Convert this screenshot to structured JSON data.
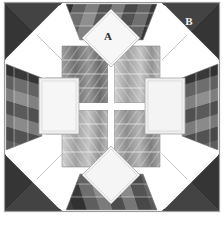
{
  "figure": {
    "type": "quilt-block-diagram",
    "width": 224,
    "height": 225,
    "background_color": "#ffffff"
  },
  "labels": [
    {
      "id": "A",
      "text": "A",
      "x": 108,
      "y": 37,
      "target": "top-center-light-diamond",
      "color": "#2b2b2b"
    },
    {
      "id": "B",
      "text": "B",
      "x": 189,
      "y": 22,
      "target": "top-right-dark-corner-triangle",
      "color": "#f2f2f2"
    }
  ],
  "palette": {
    "background": "#ffffff",
    "sashing": "#ffffff",
    "outline": "#8f8f8f",
    "corner_dark": "#3c3c3c",
    "corner_dark_shade": "#2f2f2f",
    "dark_1": "#2e2e2e",
    "dark_2": "#3a3a3a",
    "dark_3": "#484848",
    "dark_4": "#565656",
    "mid_1": "#6e6e6e",
    "mid_2": "#808080",
    "mid_3": "#949494",
    "mid_4": "#a6a6a6",
    "light_1": "#bdbdbd",
    "light_2": "#cfcfcf",
    "light_3": "#dedede",
    "light_4": "#eaeaea",
    "white_patch": "#f3f3f3",
    "white_patch_2": "#ececec"
  },
  "geometry": {
    "block_left": 4,
    "block_top": 2,
    "block_right": 220,
    "block_bottom": 212,
    "center_x": 111,
    "center_y": 106
  },
  "regions": [
    {
      "name": "corner-triangle-top-left",
      "shade": "dark"
    },
    {
      "name": "corner-triangle-top-right",
      "shade": "dark",
      "label": "B"
    },
    {
      "name": "corner-triangle-bottom-left",
      "shade": "dark"
    },
    {
      "name": "corner-triangle-bottom-right",
      "shade": "dark"
    },
    {
      "name": "light-diamond-top",
      "shade": "white",
      "label": "A"
    },
    {
      "name": "light-square-left",
      "shade": "white"
    },
    {
      "name": "light-square-right",
      "shade": "white"
    },
    {
      "name": "light-diamond-bottom",
      "shade": "white"
    },
    {
      "name": "center-star",
      "shade": "graded-chevron"
    },
    {
      "name": "edge-band-top",
      "shade": "graded"
    },
    {
      "name": "edge-band-bottom",
      "shade": "graded"
    },
    {
      "name": "edge-band-left",
      "shade": "graded"
    },
    {
      "name": "edge-band-right",
      "shade": "graded"
    }
  ]
}
